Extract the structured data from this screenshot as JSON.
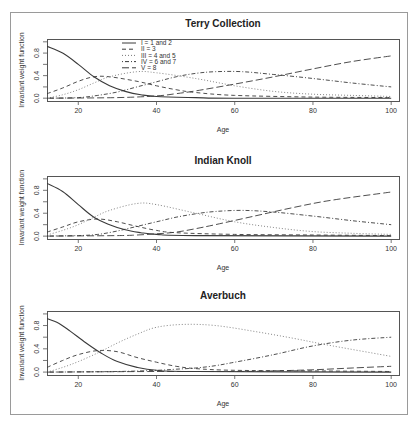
{
  "chart_data": [
    {
      "type": "line",
      "title": "Terry Collection",
      "xlabel": "Age",
      "ylabel": "Invariant weight function",
      "xlim": [
        12,
        102
      ],
      "ylim": [
        -0.05,
        1.05
      ],
      "xticks": [
        20,
        40,
        60,
        80,
        100
      ],
      "yticks": [
        0.0,
        0.4,
        0.8
      ],
      "legend": true,
      "series": [
        {
          "name": "I = 1 and 2",
          "style": "solid",
          "x": [
            12,
            16,
            20,
            24,
            28,
            32,
            36,
            40,
            50,
            60,
            100
          ],
          "y": [
            0.92,
            0.8,
            0.6,
            0.38,
            0.22,
            0.12,
            0.06,
            0.03,
            0.01,
            0.0,
            0.0
          ]
        },
        {
          "name": "II = 3",
          "style": "dashed",
          "x": [
            12,
            16,
            20,
            24,
            28,
            35,
            40,
            45,
            50,
            60,
            80,
            100
          ],
          "y": [
            0.08,
            0.18,
            0.3,
            0.38,
            0.38,
            0.3,
            0.22,
            0.15,
            0.1,
            0.05,
            0.02,
            0.01
          ]
        },
        {
          "name": "III = 4 and 5",
          "style": "dotted",
          "x": [
            12,
            16,
            20,
            24,
            28,
            35,
            40,
            50,
            60,
            70,
            80,
            90,
            100
          ],
          "y": [
            0.0,
            0.06,
            0.15,
            0.27,
            0.38,
            0.47,
            0.45,
            0.35,
            0.22,
            0.12,
            0.07,
            0.05,
            0.03
          ]
        },
        {
          "name": "IV = 6 and 7",
          "style": "dotdash",
          "x": [
            12,
            20,
            25,
            30,
            35,
            40,
            45,
            50,
            55,
            62,
            70,
            80,
            90,
            100
          ],
          "y": [
            0.0,
            0.01,
            0.05,
            0.11,
            0.2,
            0.29,
            0.38,
            0.44,
            0.47,
            0.47,
            0.42,
            0.35,
            0.27,
            0.2
          ]
        },
        {
          "name": "V = 8",
          "style": "longdash",
          "x": [
            12,
            30,
            40,
            45,
            50,
            60,
            70,
            80,
            90,
            100
          ],
          "y": [
            0.0,
            0.01,
            0.04,
            0.08,
            0.13,
            0.25,
            0.38,
            0.52,
            0.65,
            0.75
          ]
        }
      ]
    },
    {
      "type": "line",
      "title": "Indian Knoll",
      "xlabel": "Age",
      "ylabel": "Invariant weight function",
      "xlim": [
        12,
        102
      ],
      "ylim": [
        -0.05,
        1.05
      ],
      "xticks": [
        20,
        40,
        60,
        80,
        100
      ],
      "yticks": [
        0.0,
        0.4,
        0.8
      ],
      "legend": false,
      "series": [
        {
          "name": "I = 1 and 2",
          "style": "solid",
          "x": [
            12,
            16,
            20,
            24,
            28,
            32,
            36,
            40,
            50,
            100
          ],
          "y": [
            0.92,
            0.78,
            0.55,
            0.33,
            0.2,
            0.11,
            0.06,
            0.03,
            0.01,
            0.0
          ]
        },
        {
          "name": "II = 3",
          "style": "dashed",
          "x": [
            12,
            16,
            20,
            25,
            30,
            35,
            40,
            45,
            60,
            80,
            100
          ],
          "y": [
            0.07,
            0.16,
            0.25,
            0.3,
            0.25,
            0.17,
            0.1,
            0.06,
            0.03,
            0.02,
            0.01
          ]
        },
        {
          "name": "III = 4 and 5",
          "style": "dotted",
          "x": [
            12,
            16,
            20,
            24,
            28,
            35,
            40,
            50,
            60,
            70,
            80,
            90,
            100
          ],
          "y": [
            0.02,
            0.1,
            0.2,
            0.33,
            0.45,
            0.57,
            0.55,
            0.4,
            0.25,
            0.15,
            0.08,
            0.05,
            0.03
          ]
        },
        {
          "name": "IV = 6 and 7",
          "style": "dotdash",
          "x": [
            12,
            20,
            25,
            30,
            35,
            40,
            45,
            50,
            55,
            62,
            70,
            80,
            90,
            100
          ],
          "y": [
            0.0,
            0.01,
            0.03,
            0.09,
            0.17,
            0.25,
            0.33,
            0.39,
            0.43,
            0.45,
            0.42,
            0.35,
            0.27,
            0.2
          ]
        },
        {
          "name": "V = 8",
          "style": "longdash",
          "x": [
            12,
            30,
            35,
            40,
            45,
            50,
            55,
            65,
            75,
            85,
            100
          ],
          "y": [
            0.0,
            0.01,
            0.02,
            0.04,
            0.07,
            0.13,
            0.2,
            0.35,
            0.5,
            0.63,
            0.77
          ]
        }
      ]
    },
    {
      "type": "line",
      "title": "Averbuch",
      "xlabel": "Age",
      "ylabel": "Invariant weight function",
      "xlim": [
        12,
        102
      ],
      "ylim": [
        -0.05,
        1.05
      ],
      "xticks": [
        20,
        40,
        60,
        80,
        100
      ],
      "yticks": [
        0.0,
        0.4,
        0.8
      ],
      "legend": false,
      "series": [
        {
          "name": "I = 1 and 2",
          "style": "solid",
          "x": [
            12,
            15,
            18,
            22,
            26,
            30,
            35,
            40,
            50,
            100
          ],
          "y": [
            0.92,
            0.84,
            0.7,
            0.5,
            0.32,
            0.18,
            0.08,
            0.03,
            0.01,
            0.0
          ]
        },
        {
          "name": "II = 3",
          "style": "dashed",
          "x": [
            12,
            16,
            20,
            25,
            30,
            35,
            40,
            45,
            50,
            60,
            80,
            100
          ],
          "y": [
            0.08,
            0.2,
            0.3,
            0.37,
            0.35,
            0.25,
            0.17,
            0.1,
            0.06,
            0.03,
            0.02,
            0.01
          ]
        },
        {
          "name": "III = 4 and 5",
          "style": "dotted",
          "x": [
            12,
            16,
            20,
            25,
            30,
            35,
            40,
            47,
            55,
            65,
            75,
            85,
            100
          ],
          "y": [
            0.0,
            0.08,
            0.18,
            0.33,
            0.5,
            0.65,
            0.77,
            0.82,
            0.8,
            0.7,
            0.58,
            0.45,
            0.27
          ]
        },
        {
          "name": "IV = 6 and 7",
          "style": "dotdash",
          "x": [
            12,
            30,
            40,
            45,
            50,
            55,
            60,
            70,
            80,
            90,
            100
          ],
          "y": [
            0.0,
            0.01,
            0.03,
            0.05,
            0.07,
            0.11,
            0.17,
            0.3,
            0.45,
            0.55,
            0.6
          ]
        },
        {
          "name": "V = 8",
          "style": "longdash",
          "x": [
            12,
            40,
            60,
            70,
            80,
            90,
            100
          ],
          "y": [
            0.0,
            0.01,
            0.01,
            0.02,
            0.04,
            0.07,
            0.1
          ]
        }
      ]
    }
  ],
  "legend": {
    "items": [
      "I = 1 and 2",
      "II = 3",
      "III = 4 and 5",
      "IV = 6 and 7",
      "V = 8"
    ]
  },
  "colors": {
    "line": "#3a3a3a",
    "frame": "#555555",
    "outer_frame": "#9a9a9a"
  }
}
